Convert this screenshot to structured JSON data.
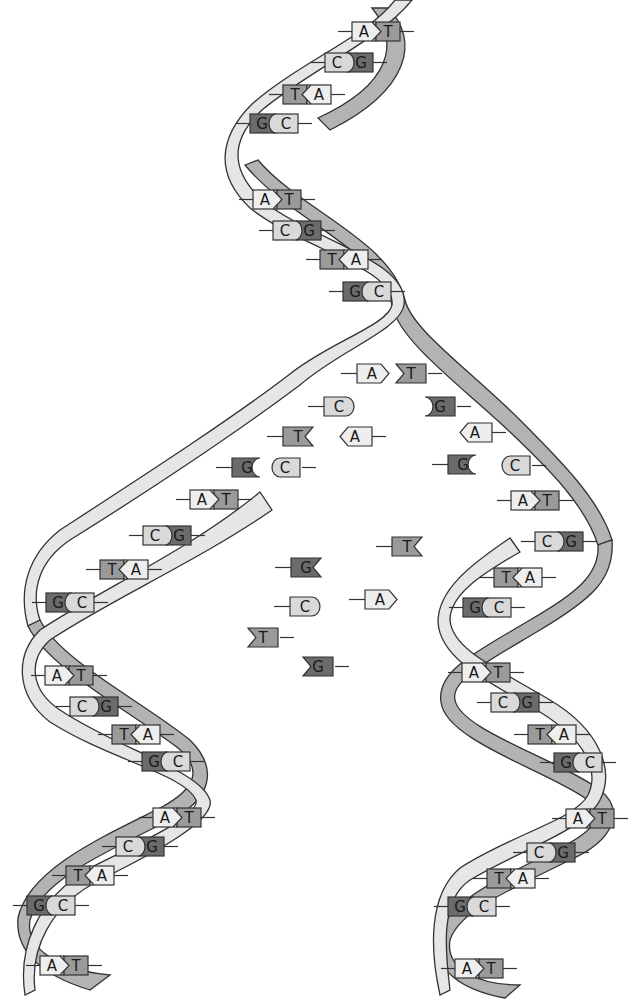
{
  "diagram": {
    "type": "DNA replication fork",
    "colors": {
      "A": "#eeeeee",
      "T": "#9a9a9a",
      "C": "#d9d9d9",
      "G": "#6b6b6b",
      "strand_light": "#e6e6e6",
      "strand_dark": "#b3b3b3",
      "outline": "#333333"
    },
    "parent_helix": {
      "pairs": [
        {
          "left": "A",
          "right": "T",
          "x": 352,
          "y": 22
        },
        {
          "left": "C",
          "right": "G",
          "x": 325,
          "y": 53
        },
        {
          "left": "T",
          "right": "A",
          "x": 283,
          "y": 85
        },
        {
          "left": "G",
          "right": "C",
          "x": 250,
          "y": 114
        },
        {
          "left": "A",
          "right": "T",
          "x": 253,
          "y": 190
        },
        {
          "left": "C",
          "right": "G",
          "x": 273,
          "y": 221
        },
        {
          "left": "T",
          "right": "A",
          "x": 320,
          "y": 250
        },
        {
          "left": "G",
          "right": "C",
          "x": 343,
          "y": 282
        }
      ]
    },
    "fork_unpaired": [
      {
        "base": "A",
        "x": 357,
        "y": 364,
        "dir": "right-point"
      },
      {
        "base": "T",
        "x": 396,
        "y": 364,
        "dir": "left-notch"
      },
      {
        "base": "C",
        "x": 324,
        "y": 397,
        "dir": "right-round"
      },
      {
        "base": "G",
        "x": 425,
        "y": 397,
        "dir": "left-cup"
      },
      {
        "base": "T",
        "x": 283,
        "y": 427,
        "dir": "right-notch"
      },
      {
        "base": "A",
        "x": 340,
        "y": 427,
        "dir": "left-point"
      },
      {
        "base": "A",
        "x": 460,
        "y": 423,
        "dir": "left-point"
      },
      {
        "base": "G",
        "x": 232,
        "y": 458,
        "dir": "right-cup"
      },
      {
        "base": "C",
        "x": 270,
        "y": 458,
        "dir": "left-round"
      },
      {
        "base": "G",
        "x": 448,
        "y": 455,
        "dir": "right-cup"
      },
      {
        "base": "C",
        "x": 500,
        "y": 456,
        "dir": "left-round"
      }
    ],
    "free_nucleotides": [
      {
        "base": "T",
        "x": 392,
        "y": 537,
        "dir": "right-notch"
      },
      {
        "base": "G",
        "x": 291,
        "y": 558,
        "dir": "right-notch"
      },
      {
        "base": "A",
        "x": 365,
        "y": 590,
        "dir": "right-point"
      },
      {
        "base": "C",
        "x": 290,
        "y": 597,
        "dir": "right-round"
      },
      {
        "base": "T",
        "x": 248,
        "y": 628,
        "dir": "left-notch"
      },
      {
        "base": "G",
        "x": 303,
        "y": 657,
        "dir": "left-notch"
      }
    ],
    "left_daughter": {
      "pairs": [
        {
          "left": "A",
          "right": "T",
          "x": 190,
          "y": 490
        },
        {
          "left": "C",
          "right": "G",
          "x": 143,
          "y": 526
        },
        {
          "left": "T",
          "right": "A",
          "x": 100,
          "y": 560
        },
        {
          "left": "G",
          "right": "C",
          "x": 46,
          "y": 593
        },
        {
          "left": "A",
          "right": "T",
          "x": 45,
          "y": 666
        },
        {
          "left": "C",
          "right": "G",
          "x": 70,
          "y": 697
        },
        {
          "left": "T",
          "right": "A",
          "x": 112,
          "y": 725
        },
        {
          "left": "G",
          "right": "C",
          "x": 142,
          "y": 752
        },
        {
          "left": "A",
          "right": "T",
          "x": 153,
          "y": 808
        },
        {
          "left": "C",
          "right": "G",
          "x": 116,
          "y": 837
        },
        {
          "left": "T",
          "right": "A",
          "x": 66,
          "y": 866
        },
        {
          "left": "G",
          "right": "C",
          "x": 27,
          "y": 896
        },
        {
          "left": "A",
          "right": "T",
          "x": 40,
          "y": 956
        }
      ]
    },
    "right_daughter": {
      "pairs": [
        {
          "left": "A",
          "right": "T",
          "x": 511,
          "y": 491
        },
        {
          "left": "C",
          "right": "G",
          "x": 535,
          "y": 532
        },
        {
          "left": "T",
          "right": "A",
          "x": 494,
          "y": 568
        },
        {
          "left": "G",
          "right": "C",
          "x": 463,
          "y": 598
        },
        {
          "left": "A",
          "right": "T",
          "x": 462,
          "y": 663
        },
        {
          "left": "C",
          "right": "G",
          "x": 491,
          "y": 693
        },
        {
          "left": "T",
          "right": "A",
          "x": 528,
          "y": 725
        },
        {
          "left": "G",
          "right": "C",
          "x": 554,
          "y": 753
        },
        {
          "left": "A",
          "right": "T",
          "x": 566,
          "y": 809
        },
        {
          "left": "C",
          "right": "G",
          "x": 527,
          "y": 843
        },
        {
          "left": "T",
          "right": "A",
          "x": 487,
          "y": 869
        },
        {
          "left": "G",
          "right": "C",
          "x": 448,
          "y": 897
        },
        {
          "left": "A",
          "right": "T",
          "x": 455,
          "y": 959
        }
      ]
    }
  }
}
